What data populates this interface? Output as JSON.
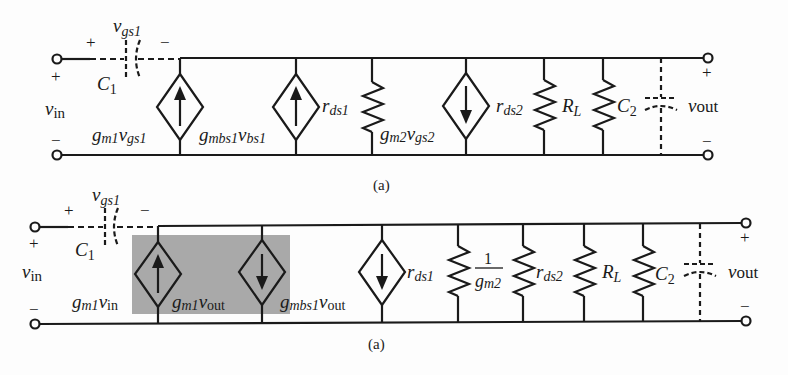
{
  "figure": {
    "type": "small-signal equivalent circuits",
    "background": "#fdfdfd",
    "line_color": "#1a1a1a",
    "highlight_color": "#a9a9a9"
  },
  "circuit_top": {
    "caption": "(a)",
    "input": {
      "label_v": "v",
      "label_sub": "in",
      "plus": "+",
      "minus": "−"
    },
    "output": {
      "label_v": "v",
      "label_sub": "out",
      "plus": "+",
      "minus": "−"
    },
    "c1": {
      "label": "C",
      "sub": "1",
      "plus": "+",
      "minus": "−",
      "vlabel": "v",
      "vsub": "gs1"
    },
    "components": [
      {
        "type": "current-source",
        "direction": "up",
        "label": "g",
        "sub1": "m1",
        "v": "v",
        "sub2": "gs1"
      },
      {
        "type": "current-source",
        "direction": "up",
        "label": "g",
        "sub1": "mbs1",
        "v": "v",
        "sub2": "bs1"
      },
      {
        "type": "resistor",
        "label": "r",
        "sub": "ds1"
      },
      {
        "type": "current-source",
        "direction": "down",
        "label": "g",
        "sub1": "m2",
        "v": "v",
        "sub2": "gs2"
      },
      {
        "type": "resistor",
        "label": "r",
        "sub": "ds2"
      },
      {
        "type": "resistor",
        "label": "R",
        "sub": "L"
      },
      {
        "type": "capacitor",
        "label": "C",
        "sub": "2"
      }
    ]
  },
  "circuit_bottom": {
    "caption": "(a)",
    "input": {
      "label_v": "v",
      "label_sub": "in",
      "plus": "+",
      "minus": "−"
    },
    "output": {
      "label_v": "v",
      "label_sub": "out",
      "plus": "+",
      "minus": "−"
    },
    "c1": {
      "label": "C",
      "sub": "1",
      "plus": "+",
      "minus": "−",
      "vlabel": "v",
      "vsub": "gs1"
    },
    "highlighted_group": [
      "g_m1 v_in",
      "g_m1 v_out"
    ],
    "components": [
      {
        "type": "current-source",
        "direction": "up",
        "label": "g",
        "sub1": "m1",
        "v": "v",
        "sub2": "in"
      },
      {
        "type": "current-source",
        "direction": "down",
        "label": "g",
        "sub1": "m1",
        "v": "v",
        "sub2": "out"
      },
      {
        "type": "current-source",
        "direction": "down",
        "label": "g",
        "sub1": "mbs1",
        "v": "v",
        "sub2": "out"
      },
      {
        "type": "resistor",
        "label": "r",
        "sub": "ds1"
      },
      {
        "type": "resistor",
        "label_num": "1",
        "label_den": "g",
        "den_sub": "m2"
      },
      {
        "type": "resistor",
        "label": "r",
        "sub": "ds2"
      },
      {
        "type": "resistor",
        "label": "R",
        "sub": "L"
      },
      {
        "type": "capacitor",
        "label": "C",
        "sub": "2"
      }
    ]
  }
}
